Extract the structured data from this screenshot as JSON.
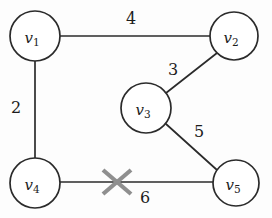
{
  "diagram": {
    "background_color": "#fdfdfd",
    "stroke_color": "#2b2b2b",
    "cross_color": "#8f8f8f"
  },
  "nodes": [
    {
      "id": "v1",
      "base": "v",
      "sub": "1",
      "cx": 35,
      "cy": 36,
      "r": 25
    },
    {
      "id": "v2",
      "base": "v",
      "sub": "2",
      "cx": 234,
      "cy": 36,
      "r": 24
    },
    {
      "id": "v3",
      "base": "v",
      "sub": "3",
      "cx": 146,
      "cy": 108,
      "r": 25
    },
    {
      "id": "v4",
      "base": "v",
      "sub": "4",
      "cx": 35,
      "cy": 183,
      "r": 25
    },
    {
      "id": "v5",
      "base": "v",
      "sub": "5",
      "cx": 236,
      "cy": 183,
      "r": 23
    }
  ],
  "edges": [
    {
      "id": "e-v1-v2",
      "from": "v1",
      "to": "v2",
      "weight": "4",
      "label_x": 131,
      "label_y": 18,
      "crossed": false
    },
    {
      "id": "e-v1-v4",
      "from": "v1",
      "to": "v4",
      "weight": "2",
      "label_x": 16,
      "label_y": 107,
      "crossed": false
    },
    {
      "id": "e-v3-v2",
      "from": "v3",
      "to": "v2",
      "weight": "3",
      "label_x": 173,
      "label_y": 69,
      "crossed": false
    },
    {
      "id": "e-v3-v5",
      "from": "v3",
      "to": "v5",
      "weight": "5",
      "label_x": 199,
      "label_y": 131,
      "crossed": false
    },
    {
      "id": "e-v4-v5",
      "from": "v4",
      "to": "v5",
      "weight": "6",
      "label_x": 145,
      "label_y": 197,
      "crossed": true
    }
  ],
  "cross_mark": {
    "id": "cross-v4-v5",
    "cx": 117,
    "cy": 182,
    "half_width": 14,
    "half_height": 12,
    "color": "#8f8f8f"
  }
}
